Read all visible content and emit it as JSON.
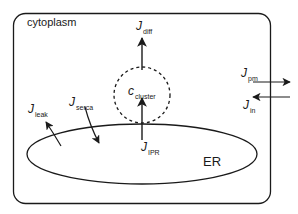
{
  "diagram": {
    "colors": {
      "stroke": "#1a1a1a",
      "background": "#ffffff"
    },
    "compartments": {
      "cytoplasm": {
        "label": "cytoplasm"
      },
      "er": {
        "label": "ER"
      },
      "cluster": {
        "symbol": "c",
        "subscript": "cluster"
      }
    },
    "fluxes": [
      {
        "id": "diff",
        "symbol": "J",
        "subscript": "diff",
        "direction": "up, out of cluster"
      },
      {
        "id": "ipr",
        "symbol": "J",
        "subscript": "IPR",
        "direction": "up, ER to cluster"
      },
      {
        "id": "leak",
        "symbol": "J",
        "subscript": "leak",
        "direction": "ER to cytoplasm"
      },
      {
        "id": "serca",
        "symbol": "J",
        "subscript": "serca",
        "direction": "cytoplasm to ER"
      },
      {
        "id": "pm",
        "symbol": "J",
        "subscript": "pm",
        "direction": "out through membrane"
      },
      {
        "id": "in",
        "symbol": "J",
        "subscript": "in",
        "direction": "in through membrane"
      }
    ]
  }
}
